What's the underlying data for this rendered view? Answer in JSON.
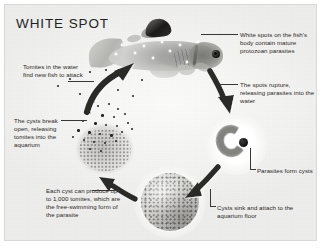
{
  "diagram": {
    "title": "WHITE SPOT",
    "type": "parasite-life-cycle",
    "palette": {
      "background": "#f2f2f1",
      "border": "#d8d8d6",
      "text": "#2b2724",
      "title": "#221f1e",
      "arrow": "#2c2a27",
      "leader_line": "#3a3633"
    },
    "labels": [
      {
        "id": "white-spots",
        "text": "White spots on the fish's body contain mature protozoan parasites",
        "position": "top-right"
      },
      {
        "id": "spots-rupture",
        "text": "The spots rupture, releasing parasites into the water",
        "position": "right"
      },
      {
        "id": "parasites-form-cysts",
        "text": "Parasites form cysts",
        "position": "right-lower"
      },
      {
        "id": "cysts-sink",
        "text": "Cysts sink and attach to the aquarium floor",
        "position": "bottom-right"
      },
      {
        "id": "each-cyst",
        "text": "Each cyst can produce up to 1,000 tomites, which are the free-swimming form of the parasite",
        "position": "bottom-left"
      },
      {
        "id": "cysts-break-open",
        "text": "The cysts break open, releasing tomites into the aquarium",
        "position": "left-lower"
      },
      {
        "id": "tomites-find-fish",
        "text": "Tomites in the water find new fish to attack",
        "position": "left-upper"
      }
    ],
    "figures": [
      {
        "id": "fish",
        "name": "infected-fish-photograph",
        "caption_link": "white-spots"
      },
      {
        "id": "ruptured-cyst",
        "name": "bursting-cyst-releasing-tomites",
        "caption_link": "cysts-break-open"
      },
      {
        "id": "tomite-sphere",
        "name": "cyst-full-of-tomites",
        "caption_link": "each-cyst"
      },
      {
        "id": "encysted-parasite",
        "name": "c-shaped-parasite-cyst",
        "caption_link": "parasites-form-cysts"
      }
    ],
    "arrows": [
      {
        "id": "arrow-tomites-to-fish",
        "from": "ruptured-cyst",
        "to": "fish",
        "direction": "up-right"
      },
      {
        "id": "arrow-fish-to-cyst",
        "from": "fish",
        "to": "encysted-parasite",
        "direction": "down-right"
      },
      {
        "id": "arrow-cyst-to-tomites",
        "from": "encysted-parasite",
        "to": "tomite-sphere",
        "direction": "down-left"
      },
      {
        "id": "arrow-tomites-to-burst",
        "from": "tomite-sphere",
        "to": "ruptured-cyst",
        "direction": "up-left"
      }
    ]
  }
}
